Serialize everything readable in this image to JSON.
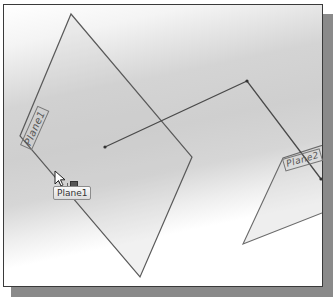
{
  "viewport": {
    "background_gradient": [
      "#ffffff",
      "#d0d0d0",
      "#ffffff"
    ],
    "frame_color": "#3a3a3a",
    "shadow_color": "#8a8a8a"
  },
  "planes": [
    {
      "name": "Plane1",
      "label": "Plane1",
      "vertices": [
        [
          71,
          14
        ],
        [
          192,
          157
        ],
        [
          140,
          277
        ],
        [
          20,
          136
        ]
      ]
    },
    {
      "name": "Plane2",
      "label": "Plane2",
      "vertices": [
        [
          283,
          158
        ],
        [
          324,
          145
        ],
        [
          322,
          213
        ],
        [
          243,
          244
        ]
      ]
    }
  ],
  "sketch_polyline": {
    "points": [
      [
        105,
        147
      ],
      [
        247,
        81
      ],
      [
        321,
        179
      ]
    ],
    "color": "#4a4a4a"
  },
  "cursor": {
    "type": "arrow-pointer",
    "x": 56,
    "y": 172
  },
  "tooltip": {
    "text": "Plane1"
  }
}
